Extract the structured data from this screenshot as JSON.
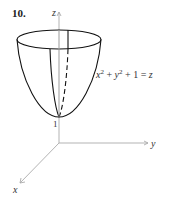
{
  "problem": {
    "number": "10."
  },
  "axes": {
    "x_label": "x",
    "y_label": "y",
    "z_label": "z",
    "axis_color": "#aaaaaa"
  },
  "surface": {
    "equation_parts": {
      "x": "x",
      "x_exp": "2",
      "plus1": " + ",
      "y": "y",
      "y_exp": "2",
      "plus2": " + 1 = ",
      "z": "z"
    },
    "vertex_label": "1",
    "stroke_color": "#111111"
  }
}
